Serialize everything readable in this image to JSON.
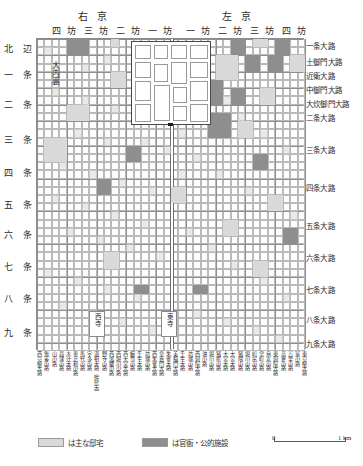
{
  "map": {
    "title": "平安京",
    "palace_label": "大内裏",
    "regions": [
      {
        "name": "右京",
        "id": "ukyo"
      },
      {
        "name": "左京",
        "id": "sakyo"
      }
    ],
    "bo_columns": [
      "四 坊",
      "三 坊",
      "二 坊",
      "一 坊",
      "一 坊",
      "二 坊",
      "三 坊",
      "四 坊"
    ],
    "row_labels": [
      "北 辺",
      "一 条",
      "二 条",
      "三 条",
      "四 条",
      "五 条",
      "六 条",
      "七 条",
      "八 条",
      "九 条"
    ],
    "right_street_labels": [
      "一条大路",
      "土御門大路",
      "近衛大路",
      "中御門大路",
      "大炊御門大路",
      "二条大路",
      "三条大路",
      "四条大路",
      "五条大路",
      "六条大路",
      "七条大路",
      "八条大路",
      "九条大路"
    ],
    "bottom_street_labels": [
      "西京極大路",
      "無差小路",
      "山小路",
      "昌蒲小路",
      "木辻大路",
      "恵止利小路",
      "馬代小路",
      "宇多小路",
      "道祖大路（佐比大）",
      "野寺小路",
      "西鴻臚小路",
      "西堀川小路",
      "西大宮大路",
      "櫛笥小路",
      "壬生大路",
      "坊城小路",
      "西朱雀大路",
      "皇嘉門大路",
      "朱雀大路",
      "美福門大路",
      "壬生大路",
      "坊城小路",
      "西洞院大路",
      "油小路",
      "堀川小路",
      "猪熊小路",
      "大宮大路",
      "大宮大路",
      "猪隈小路",
      "堀川小路",
      "町尻小路",
      "室町小路",
      "烏丸小路",
      "東洞院大路",
      "高倉小路",
      "万里小路",
      "富小路",
      "東京極大路"
    ],
    "temples": [
      {
        "name": "西寺"
      },
      {
        "name": "東寺"
      }
    ]
  },
  "legend": {
    "items": [
      {
        "swatch": "light",
        "text": "は主な邸宅"
      },
      {
        "swatch": "dark",
        "text": "は官衙・公的施設"
      }
    ]
  },
  "scale": {
    "zero": "0",
    "one": "1 km"
  },
  "colors": {
    "residence": "#d9d9d9",
    "government": "#8e8e8e",
    "grid_line": "#b9b9b9",
    "avenue_line": "#8f8f8f"
  },
  "chart_data": {
    "type": "map",
    "grid": {
      "cols": 36,
      "rows": 38
    },
    "shaded_blocks": [
      {
        "col": 4,
        "row": 0,
        "w": 3,
        "h": 2,
        "type": "government"
      },
      {
        "col": 10,
        "row": 0,
        "w": 1,
        "h": 1,
        "type": "residence"
      },
      {
        "col": 26,
        "row": 0,
        "w": 2,
        "h": 2,
        "type": "government"
      },
      {
        "col": 29,
        "row": 0,
        "w": 2,
        "h": 1,
        "type": "residence"
      },
      {
        "col": 32,
        "row": 0,
        "w": 2,
        "h": 2,
        "type": "government"
      },
      {
        "col": 24,
        "row": 2,
        "w": 3,
        "h": 3,
        "type": "residence"
      },
      {
        "col": 28,
        "row": 2,
        "w": 2,
        "h": 2,
        "type": "government"
      },
      {
        "col": 31,
        "row": 2,
        "w": 2,
        "h": 2,
        "type": "government"
      },
      {
        "col": 34,
        "row": 2,
        "w": 2,
        "h": 2,
        "type": "residence"
      },
      {
        "col": 10,
        "row": 4,
        "w": 2,
        "h": 2,
        "type": "residence"
      },
      {
        "col": 23,
        "row": 5,
        "w": 2,
        "h": 3,
        "type": "government"
      },
      {
        "col": 26,
        "row": 6,
        "w": 2,
        "h": 2,
        "type": "government"
      },
      {
        "col": 30,
        "row": 6,
        "w": 2,
        "h": 2,
        "type": "residence"
      },
      {
        "col": 4,
        "row": 8,
        "w": 3,
        "h": 2,
        "type": "residence"
      },
      {
        "col": 23,
        "row": 9,
        "w": 3,
        "h": 3,
        "type": "government"
      },
      {
        "col": 27,
        "row": 10,
        "w": 2,
        "h": 2,
        "type": "residence"
      },
      {
        "col": 1,
        "row": 12,
        "w": 3,
        "h": 3,
        "type": "residence"
      },
      {
        "col": 12,
        "row": 13,
        "w": 2,
        "h": 2,
        "type": "government"
      },
      {
        "col": 29,
        "row": 14,
        "w": 2,
        "h": 2,
        "type": "government"
      },
      {
        "col": 8,
        "row": 17,
        "w": 2,
        "h": 2,
        "type": "government"
      },
      {
        "col": 18,
        "row": 18,
        "w": 2,
        "h": 2,
        "type": "residence"
      },
      {
        "col": 31,
        "row": 19,
        "w": 2,
        "h": 2,
        "type": "residence"
      },
      {
        "col": 25,
        "row": 22,
        "w": 2,
        "h": 2,
        "type": "residence"
      },
      {
        "col": 33,
        "row": 23,
        "w": 2,
        "h": 2,
        "type": "government"
      },
      {
        "col": 9,
        "row": 26,
        "w": 2,
        "h": 2,
        "type": "residence"
      },
      {
        "col": 29,
        "row": 27,
        "w": 2,
        "h": 2,
        "type": "residence"
      },
      {
        "col": 13,
        "row": 30,
        "w": 2,
        "h": 1,
        "type": "government"
      },
      {
        "col": 21,
        "row": 30,
        "w": 2,
        "h": 1,
        "type": "government"
      }
    ]
  }
}
